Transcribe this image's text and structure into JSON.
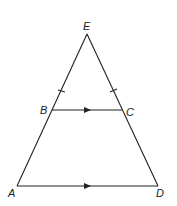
{
  "diagram": {
    "type": "geometry-triangle",
    "vertices": {
      "E": {
        "label": "E",
        "x": 87,
        "y": 34
      },
      "B": {
        "label": "B",
        "x": 52,
        "y": 110
      },
      "C": {
        "label": "C",
        "x": 122,
        "y": 110
      },
      "A": {
        "label": "A",
        "x": 17,
        "y": 186
      },
      "D": {
        "label": "D",
        "x": 158,
        "y": 186
      }
    },
    "segments": [
      {
        "from": "E",
        "to": "A"
      },
      {
        "from": "E",
        "to": "D"
      },
      {
        "from": "B",
        "to": "C",
        "marker": "parallel-arrow"
      },
      {
        "from": "A",
        "to": "D",
        "marker": "parallel-arrow"
      }
    ],
    "tick_marks": [
      "EB",
      "EC"
    ],
    "stroke_color": "#222222"
  }
}
